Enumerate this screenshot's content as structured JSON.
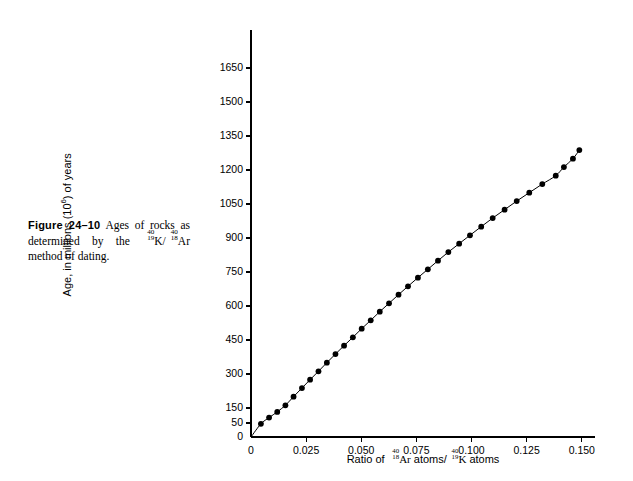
{
  "caption": {
    "figure_label": "Figure 24–10",
    "text_part1": "Ages of rocks as determined by the ",
    "isotope_k": {
      "mass": "40",
      "number": "19",
      "symbol": "K"
    },
    "isotope_ar": {
      "mass": "40",
      "number": "18",
      "symbol": "Ar"
    },
    "text_part2": "method of dating."
  },
  "chart_data": {
    "type": "scatter",
    "title": "",
    "xlabel_prefix": "Ratio of ",
    "xlabel_ar": {
      "mass": "40",
      "number": "18",
      "symbol": "Ar"
    },
    "xlabel_mid": " atoms/",
    "xlabel_k": {
      "mass": "40",
      "number": "19",
      "symbol": "K"
    },
    "xlabel_suffix": " atoms",
    "ylabel_prefix": "Age, in millions (10",
    "ylabel_exponent": "6",
    "ylabel_suffix": ") of years",
    "xticks": [
      0,
      0.025,
      0.05,
      0.075,
      0.1,
      0.125,
      0.15
    ],
    "xtick_labels": [
      "0",
      "0.025",
      "0.050",
      "0.075",
      "0.100",
      "0.125",
      "0.150"
    ],
    "yticks": [
      0,
      50,
      150,
      300,
      450,
      600,
      750,
      900,
      1050,
      1200,
      1350,
      1500,
      1650
    ],
    "ytick_labels": [
      "0",
      "50",
      "150",
      "300",
      "450",
      "600",
      "750",
      "900",
      "1050",
      "1200",
      "1350",
      "1500",
      "1650"
    ],
    "xlim": [
      0,
      0.156
    ],
    "ylim": [
      0,
      1720
    ],
    "grid": false,
    "legend": false,
    "marker": "filled-circle",
    "line_style": "solid",
    "x": [
      0.0045,
      0.0082,
      0.0119,
      0.0156,
      0.0193,
      0.0231,
      0.0268,
      0.0306,
      0.0344,
      0.0383,
      0.0422,
      0.0462,
      0.0502,
      0.0543,
      0.0584,
      0.0626,
      0.0669,
      0.0712,
      0.0757,
      0.0802,
      0.0848,
      0.0895,
      0.0944,
      0.0993,
      0.1044,
      0.1096,
      0.115,
      0.1205,
      0.1262,
      0.1321,
      0.1382,
      0.1419,
      0.146,
      0.1489
    ],
    "y": [
      47,
      86,
      124,
      162,
      200,
      238,
      275,
      312,
      350,
      388,
      425,
      462,
      500,
      537,
      575,
      612,
      650,
      687,
      725,
      762,
      800,
      838,
      875,
      912,
      950,
      988,
      1025,
      1063,
      1100,
      1138,
      1175,
      1213,
      1250,
      1288
    ],
    "points_count": 34
  }
}
